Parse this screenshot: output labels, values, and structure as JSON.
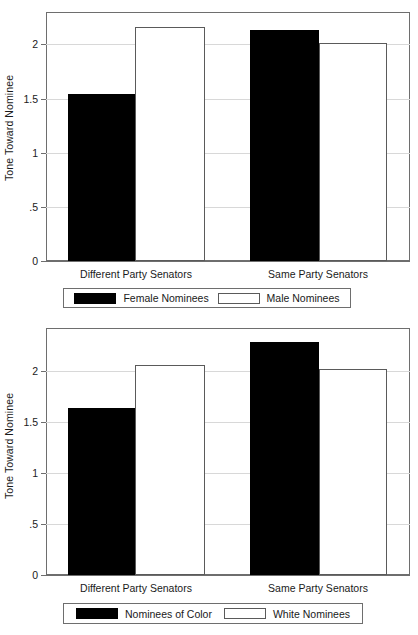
{
  "chart_data": [
    {
      "id": "top",
      "type": "bar",
      "title": "",
      "xlabel": "",
      "ylabel": "Tone Toward Nominee",
      "categories": [
        "Different Party Senators",
        "Same Party Senators"
      ],
      "yticks": [
        "0",
        ".5",
        "1",
        "1.5",
        "2"
      ],
      "ytick_values": [
        0,
        0.5,
        1,
        1.5,
        2
      ],
      "ylim": [
        0,
        2.3
      ],
      "grid": true,
      "legend_position": "below",
      "series": [
        {
          "name": "Female Nominees",
          "style": "filled",
          "color": "#000000",
          "values": [
            1.54,
            2.13
          ]
        },
        {
          "name": "Male Nominees",
          "style": "hollow",
          "color": "#ffffff",
          "values": [
            2.16,
            2.01
          ]
        }
      ]
    },
    {
      "id": "bottom",
      "type": "bar",
      "title": "",
      "xlabel": "",
      "ylabel": "Tone Toward Nominee",
      "categories": [
        "Different Party Senators",
        "Same Party Senators"
      ],
      "yticks": [
        "0",
        ".5",
        "1",
        "1.5",
        "2"
      ],
      "ytick_values": [
        0,
        0.5,
        1,
        1.5,
        2
      ],
      "ylim": [
        0,
        2.42
      ],
      "grid": true,
      "legend_position": "below",
      "series": [
        {
          "name": "Nominees of Color",
          "style": "filled",
          "color": "#000000",
          "values": [
            1.64,
            2.28
          ]
        },
        {
          "name": "White Nominees",
          "style": "hollow",
          "color": "#ffffff",
          "values": [
            2.06,
            2.02
          ]
        }
      ]
    }
  ],
  "colors": {
    "filled_bar": "#000000",
    "hollow_bar_fill": "#ffffff",
    "hollow_bar_border": "#5a5a5a",
    "frame": "#6e6e6e",
    "gridline": "#d8d8d8",
    "text": "#1a1a1a",
    "background": "#ffffff"
  }
}
